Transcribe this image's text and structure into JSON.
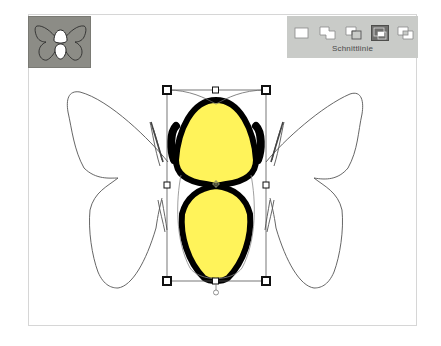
{
  "panel": {
    "label": "Schnittlinie",
    "modes": [
      {
        "icon": "new-shape-icon",
        "active": false
      },
      {
        "icon": "combine-shapes-icon",
        "active": false
      },
      {
        "icon": "subtract-front-shape-icon",
        "active": false
      },
      {
        "icon": "intersect-shape-areas-icon",
        "active": true
      },
      {
        "icon": "exclude-overlapping-shapes-icon",
        "active": false
      }
    ]
  },
  "thumbnail": {
    "icon": "butterfly-thumbnail-icon"
  },
  "canvas": {
    "shape": "butterfly",
    "colors": {
      "body_fill": "#fff35a",
      "body_stroke": "#000000",
      "wing_stroke": "#555555",
      "thumbnail_bg": "#8c8c86",
      "panel_bg": "#c9cbc8"
    },
    "bounding_box": {
      "x1": 167,
      "y1": 90,
      "x2": 266,
      "y2": 281
    }
  }
}
